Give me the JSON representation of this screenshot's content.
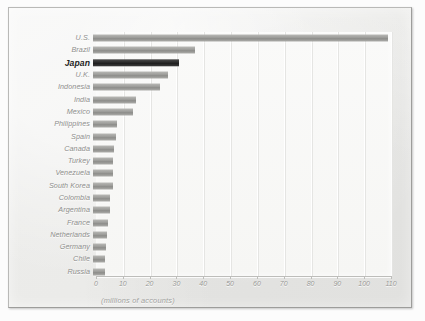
{
  "chart_data": {
    "type": "bar",
    "orientation": "horizontal",
    "title": "",
    "subtitle": "",
    "xlabel": "(millions of accounts)",
    "ylabel": "",
    "xlim": [
      0,
      110
    ],
    "xticks": [
      "0",
      "10",
      "20",
      "30",
      "40",
      "50",
      "60",
      "70",
      "80",
      "90",
      "100",
      "110"
    ],
    "grid": true,
    "legend": "none",
    "highlight_category": "Japan",
    "colors": {
      "bar": "#9c9c99",
      "bar_highlight": "#2a2a2a",
      "plot_background": "#f8f8f6",
      "plate_background": "#ececea",
      "axis": "#bdbdba",
      "label": "#8e8e8c"
    },
    "categories": [
      "U.S.",
      "Brazil",
      "Japan",
      "U.K.",
      "Indonesia",
      "India",
      "Mexico",
      "Philippines",
      "Spain",
      "Canada",
      "Turkey",
      "Venezuela",
      "South Korea",
      "Colombia",
      "Argentina",
      "France",
      "Netherlands",
      "Germany",
      "Chile",
      "Russia"
    ],
    "values": [
      110,
      38,
      32,
      28,
      25,
      16,
      15,
      9,
      8.5,
      8,
      7.5,
      7.3,
      7.3,
      6.5,
      6.3,
      5.5,
      5.3,
      5,
      4.5,
      4.3
    ]
  }
}
